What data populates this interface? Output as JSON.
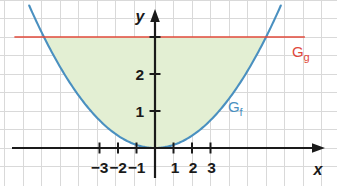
{
  "chart_data": {
    "type": "line",
    "title": "",
    "xlabel": "x",
    "ylabel": "y",
    "xlim": [
      -3.85,
      4.15
    ],
    "ylim": [
      -0.75,
      3.95
    ],
    "grid": true,
    "grid_step": 0.5,
    "legend_position": "inline-右",
    "x_tick_labels": [
      "−3",
      "−2",
      "−1",
      "1",
      "2",
      "3"
    ],
    "x_tick_values": [
      -3,
      -2,
      -1,
      1,
      2,
      3
    ],
    "y_tick_labels": [
      "1",
      "2"
    ],
    "y_tick_values": [
      1,
      2
    ],
    "y_unlabeled_ticks": [
      3
    ],
    "series": [
      {
        "name": "G_f",
        "label_main": "G",
        "label_sub": "f",
        "type": "parabola",
        "expression": "f(x) = x²/3",
        "color": "#4a90c0",
        "x": [
          -3.4,
          -3,
          -2.5,
          -2,
          -1.5,
          -1,
          -0.5,
          0,
          0.5,
          1,
          1.5,
          2,
          2.5,
          3,
          3.4
        ],
        "values": [
          3.85,
          3,
          2.08,
          1.33,
          0.75,
          0.33,
          0.08,
          0,
          0.08,
          0.33,
          0.75,
          1.33,
          2.08,
          3,
          3.85
        ]
      },
      {
        "name": "G_g",
        "label_main": "G",
        "label_sub": "g",
        "type": "horizontal-line",
        "expression": "g(x) = 3",
        "color": "#e0483a",
        "x": [
          -3.8,
          4.05
        ],
        "values": [
          3,
          3
        ]
      }
    ],
    "shaded_region": {
      "name": "area-between-curves",
      "fill_color": "#e3efd3",
      "lower": "G_f",
      "upper": "G_g",
      "x_from": -3,
      "x_to": 3
    },
    "intersections": [
      {
        "x": -3,
        "y": 3
      },
      {
        "x": 3,
        "y": 3
      }
    ],
    "colors": {
      "grid": "#d8d8d8",
      "axis": "#1a1a1a",
      "curve_f": "#4a90c0",
      "curve_g": "#e0483a",
      "fill": "#e3efd3",
      "background": "#ffffff",
      "label_text": "#1a1a1a"
    }
  },
  "axes": {
    "x_axis_name": "x",
    "y_axis_name": "y"
  },
  "labels": {
    "gf_main": "G",
    "gf_sub": "f",
    "gg_main": "G",
    "gg_sub": "g"
  },
  "ticks": {
    "x": [
      {
        "label": "−3"
      },
      {
        "label": "−2"
      },
      {
        "label": "−1"
      },
      {
        "label": "1"
      },
      {
        "label": "2"
      },
      {
        "label": "3"
      }
    ],
    "y": [
      {
        "label": "1"
      },
      {
        "label": "2"
      }
    ]
  }
}
